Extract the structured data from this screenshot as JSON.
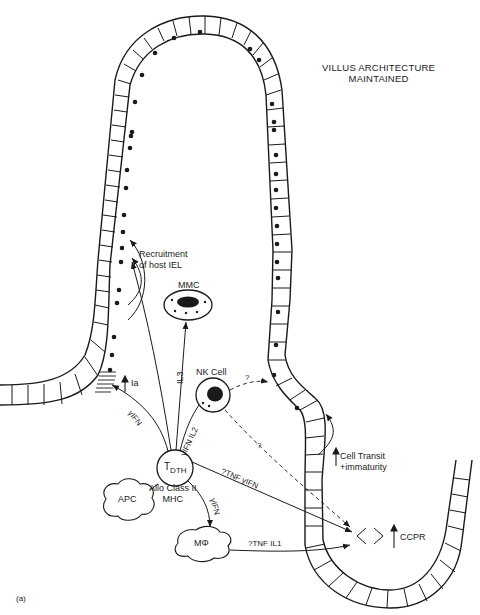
{
  "figure": {
    "panel_label": "(a)",
    "title_line1": "VILLUS ARCHITECTURE",
    "title_line2": "MAINTAINED"
  },
  "cells": {
    "mmc": "MMC",
    "nk_cell": "NK Cell",
    "t_dth_main": "T",
    "t_dth_sub": "DTH",
    "apc": "APC",
    "macrophage": "MΦ"
  },
  "annotations": {
    "recruitment_line1": "Recruitment",
    "recruitment_line2": "of host IEL",
    "ia": "Ia",
    "ia_arrow": "↑",
    "il3": "IL3",
    "ifn_gamma_left": "γIFN",
    "ifn_il2": "γIFN IL2",
    "allo_class_line1": "Allo Class II",
    "allo_class_line2": "MHC",
    "ifn_gamma_mphi": "γIFN",
    "tnf_ifn": "?TNF γIFN",
    "tnf_il1": "?TNF IL1",
    "nk_q1": "?",
    "nk_q2": "?",
    "cell_transit_line1": "Cell Transit",
    "cell_transit_line2": "+immaturity",
    "cell_transit_arrow": "↑",
    "ccpr": "CCPR",
    "ccpr_arrow": "↑"
  },
  "colors": {
    "ink": "#1a1a1a",
    "background": "#ffffff"
  }
}
